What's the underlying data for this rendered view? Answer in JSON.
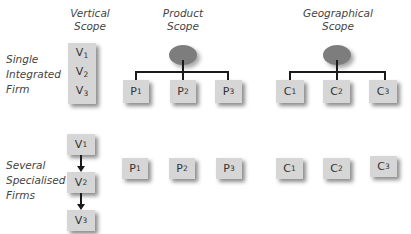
{
  "headers": {
    "vertical": [
      "Vertical",
      "Scope"
    ],
    "product": [
      "Product",
      "Scope"
    ],
    "geographical": [
      "Geographical",
      "Scope"
    ]
  },
  "rows": {
    "single": [
      "Single",
      "Integrated",
      "Firm"
    ],
    "several": [
      "Several",
      "Specialised",
      "Firms"
    ]
  },
  "vertical_items": [
    {
      "letter": "V",
      "sub": "1"
    },
    {
      "letter": "V",
      "sub": "2"
    },
    {
      "letter": "V",
      "sub": "3"
    }
  ],
  "product_items": [
    {
      "letter": "P",
      "sub": "1"
    },
    {
      "letter": "P",
      "sub": "2"
    },
    {
      "letter": "P",
      "sub": "3"
    }
  ],
  "geo_items": [
    {
      "letter": "C",
      "sub": "1"
    },
    {
      "letter": "C",
      "sub": "2"
    },
    {
      "letter": "C",
      "sub": "3"
    }
  ],
  "colors": {
    "box": "#d6d6d6",
    "ellipse": "#7d7d7d",
    "line": "#1a1a1a"
  }
}
